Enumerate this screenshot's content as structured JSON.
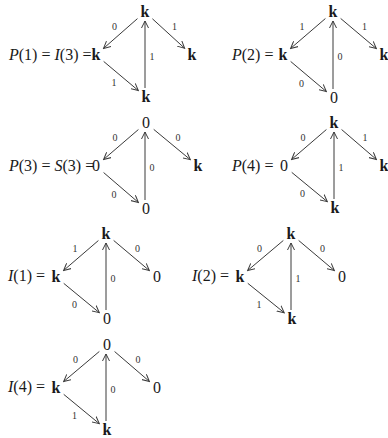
{
  "diagrams": [
    {
      "id": "P1",
      "label": "P(1) = I(3) =",
      "label_pos": [
        9,
        55
      ],
      "nodes": {
        "top": {
          "text": "k",
          "pos": [
            145,
            12
          ]
        },
        "left": {
          "text": "k",
          "pos": [
            96,
            55
          ]
        },
        "bottom": {
          "text": "k",
          "pos": [
            146,
            97
          ]
        },
        "right": {
          "text": "k",
          "pos": [
            192,
            55
          ]
        }
      },
      "edges": {
        "top_left": "0",
        "left_bottom": "1",
        "bottom_top": "1",
        "top_right": "1"
      }
    },
    {
      "id": "P2",
      "label": "P(2) =",
      "label_pos": [
        232,
        55
      ],
      "nodes": {
        "top": {
          "text": "k",
          "pos": [
            333,
            12
          ]
        },
        "left": {
          "text": "k",
          "pos": [
            283,
            55
          ]
        },
        "bottom": {
          "text": "0",
          "pos": [
            334,
            98
          ]
        },
        "right": {
          "text": "k",
          "pos": [
            384,
            55
          ]
        }
      },
      "edges": {
        "top_left": "1",
        "left_bottom": "0",
        "bottom_top": "0",
        "top_right": "1"
      }
    },
    {
      "id": "P3",
      "label": "P(3) = S(3) =",
      "label_pos": [
        9,
        166
      ],
      "nodes": {
        "top": {
          "text": "0",
          "pos": [
            146,
            123
          ]
        },
        "left": {
          "text": "0",
          "pos": [
            96,
            166
          ]
        },
        "bottom": {
          "text": "0",
          "pos": [
            146,
            209
          ]
        },
        "right": {
          "text": "k",
          "pos": [
            198,
            166
          ]
        }
      },
      "edges": {
        "top_left": "0",
        "left_bottom": "0",
        "bottom_top": "0",
        "top_right": "0"
      }
    },
    {
      "id": "P4",
      "label": "P(4) =",
      "label_pos": [
        232,
        166
      ],
      "nodes": {
        "top": {
          "text": "k",
          "pos": [
            334,
            123
          ]
        },
        "left": {
          "text": "0",
          "pos": [
            284,
            166
          ]
        },
        "bottom": {
          "text": "k",
          "pos": [
            335,
            208
          ]
        },
        "right": {
          "text": "k",
          "pos": [
            384,
            166
          ]
        }
      },
      "edges": {
        "top_left": "0",
        "left_bottom": "0",
        "bottom_top": "1",
        "top_right": "1"
      }
    },
    {
      "id": "I1",
      "label": "I(1) =",
      "label_pos": [
        8,
        276
      ],
      "nodes": {
        "top": {
          "text": "k",
          "pos": [
            106,
            234
          ]
        },
        "left": {
          "text": "k",
          "pos": [
            56,
            277
          ]
        },
        "bottom": {
          "text": "0",
          "pos": [
            107,
            319
          ]
        },
        "right": {
          "text": "0",
          "pos": [
            157,
            277
          ]
        }
      },
      "edges": {
        "top_left": "1",
        "left_bottom": "0",
        "bottom_top": "0",
        "top_right": "0"
      }
    },
    {
      "id": "I2",
      "label": "I(2) =",
      "label_pos": [
        192,
        276
      ],
      "nodes": {
        "top": {
          "text": "k",
          "pos": [
            291,
            234
          ]
        },
        "left": {
          "text": "k",
          "pos": [
            240,
            277
          ]
        },
        "bottom": {
          "text": "k",
          "pos": [
            292,
            319
          ]
        },
        "right": {
          "text": "0",
          "pos": [
            342,
            277
          ]
        }
      },
      "edges": {
        "top_left": "0",
        "left_bottom": "1",
        "bottom_top": "1",
        "top_right": "0"
      }
    },
    {
      "id": "I4",
      "label": "I(4) =",
      "label_pos": [
        8,
        387
      ],
      "nodes": {
        "top": {
          "text": "0",
          "pos": [
            107,
            345
          ]
        },
        "left": {
          "text": "k",
          "pos": [
            56,
            388
          ]
        },
        "bottom": {
          "text": "k",
          "pos": [
            107,
            430
          ]
        },
        "right": {
          "text": "0",
          "pos": [
            157,
            388
          ]
        }
      },
      "edges": {
        "top_left": "0",
        "left_bottom": "1",
        "bottom_top": "0",
        "top_right": "0"
      }
    }
  ],
  "style": {
    "arrow_color": "#3a3a3a",
    "text_color": "#1a1a1a",
    "background": "#ffffff"
  }
}
